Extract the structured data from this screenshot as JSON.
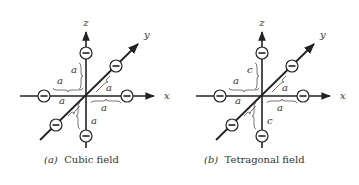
{
  "figures": [
    {
      "id": "a",
      "caption_tag": "(a)",
      "caption_text": "Cubic field",
      "axes": {
        "x": "x",
        "y": "y",
        "z": "z"
      },
      "charges": [
        "−",
        "−",
        "−",
        "−",
        "−",
        "−"
      ],
      "distance_labels": {
        "z_up": "a",
        "x_neg": "a",
        "y_pos": "a",
        "y_neg": "a",
        "x_pos": "a",
        "z_down": "a"
      }
    },
    {
      "id": "b",
      "caption_tag": "(b)",
      "caption_text": "Tetragonal field",
      "axes": {
        "x": "x",
        "y": "y",
        "z": "z"
      },
      "charges": [
        "−",
        "−",
        "−",
        "−",
        "−",
        "−"
      ],
      "distance_labels": {
        "z_up": "c",
        "x_neg": "a",
        "y_pos": "a",
        "y_neg": "a",
        "x_pos": "a",
        "z_down": "c"
      }
    }
  ]
}
